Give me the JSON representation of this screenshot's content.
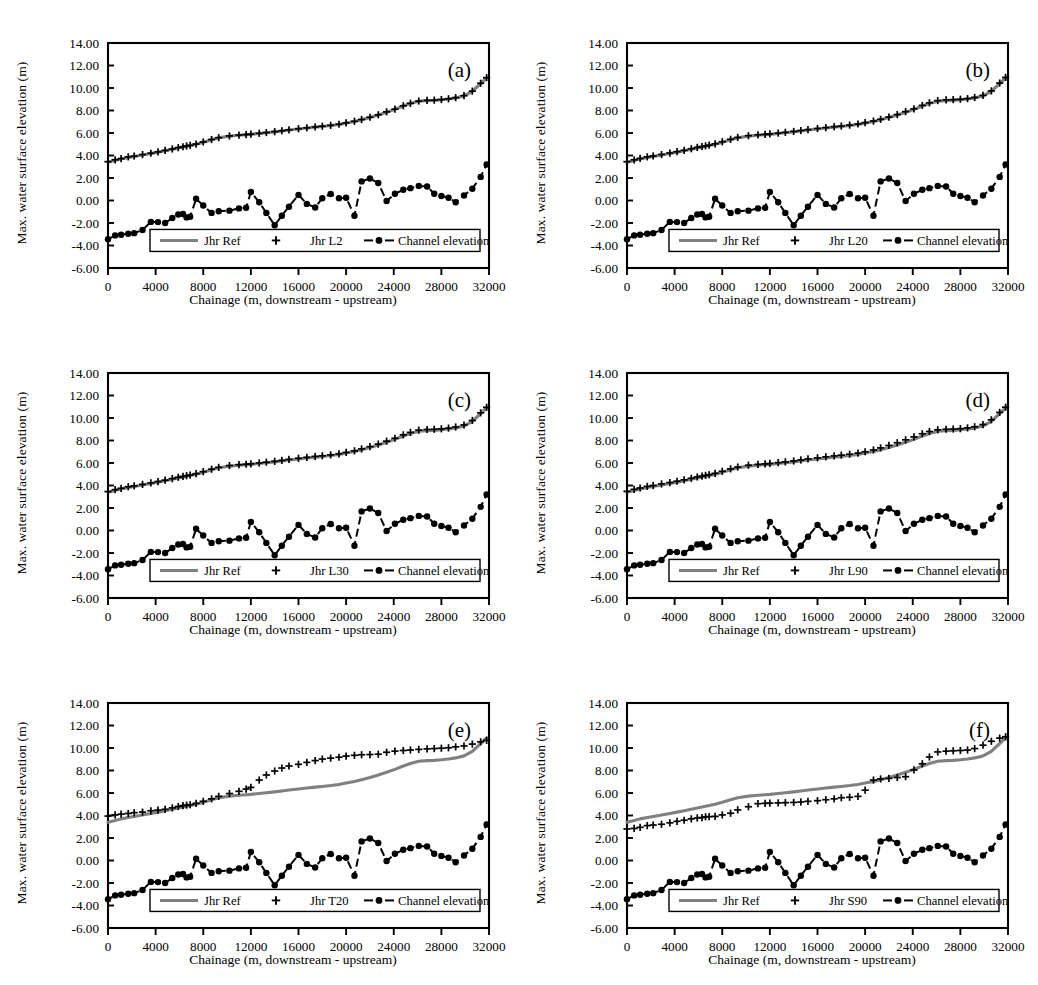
{
  "figure": {
    "panel_count": 6,
    "background": "#ffffff",
    "ink": "#000000",
    "ref_color": "#808080"
  },
  "axes": {
    "ylabel": "Max. water surface elevation (m)",
    "xlabel": "Chainage (m, downstream - upstream)",
    "ylim": [
      -6,
      14
    ],
    "xlim": [
      0,
      32000
    ],
    "ytick_step": 2,
    "xtick_step": 4000,
    "yticks": [
      "14.00",
      "12.00",
      "10.00",
      "8.00",
      "6.00",
      "4.00",
      "2.00",
      "0.00",
      "-2.00",
      "-4.00",
      "-6.00"
    ],
    "xticks": [
      "0",
      "4000",
      "8000",
      "12000",
      "16000",
      "20000",
      "24000",
      "28000",
      "32000"
    ],
    "grid": false
  },
  "legend": {
    "position": "lower-center-inside",
    "entries": [
      {
        "label": "Jhr Ref",
        "style": "solid-line",
        "color": "#808080"
      },
      {
        "label": "variant",
        "style": "plus-marker",
        "color": "#000000"
      },
      {
        "label": "Channel elevation",
        "style": "dashed-line-circle",
        "color": "#000000"
      }
    ]
  },
  "panels": [
    {
      "letter": "(a)",
      "variant_label": "Jhr L2"
    },
    {
      "letter": "(b)",
      "variant_label": "Jhr L20"
    },
    {
      "letter": "(c)",
      "variant_label": "Jhr L30"
    },
    {
      "letter": "(d)",
      "variant_label": "Jhr L90"
    },
    {
      "letter": "(e)",
      "variant_label": "Jhr T20"
    },
    {
      "letter": "(f)",
      "variant_label": "Jhr S90"
    }
  ],
  "caption": "",
  "chart_data": {
    "type": "line",
    "title": "",
    "xlabel": "Chainage (m, downstream - upstream)",
    "ylabel": "Max. water surface elevation (m)",
    "xlim": [
      0,
      32000
    ],
    "ylim": [
      -6,
      14
    ],
    "grid": false,
    "legend_position": "lower center inside axes",
    "x": [
      0,
      600,
      1100,
      1700,
      2200,
      2900,
      3600,
      4200,
      4800,
      5400,
      5900,
      6300,
      6600,
      6900,
      7400,
      8000,
      8700,
      9300,
      10200,
      11000,
      11600,
      12000,
      12700,
      13300,
      14000,
      14600,
      15200,
      16000,
      16700,
      17400,
      18000,
      18700,
      19400,
      20000,
      20700,
      21300,
      22000,
      22700,
      23400,
      24100,
      24800,
      25400,
      26100,
      26800,
      27400,
      28000,
      28600,
      29200,
      29900,
      30600,
      31300,
      31800
    ],
    "shared_series": [
      {
        "name": "Jhr Ref",
        "style": "solid",
        "color": "#808080",
        "values": [
          3.4,
          3.55,
          3.7,
          3.82,
          3.92,
          4.05,
          4.18,
          4.3,
          4.42,
          4.55,
          4.66,
          4.76,
          4.82,
          4.88,
          5.0,
          5.18,
          5.4,
          5.57,
          5.72,
          5.8,
          5.85,
          5.88,
          5.95,
          6.02,
          6.1,
          6.18,
          6.26,
          6.36,
          6.44,
          6.52,
          6.58,
          6.66,
          6.76,
          6.88,
          7.02,
          7.18,
          7.38,
          7.6,
          7.85,
          8.1,
          8.4,
          8.62,
          8.82,
          8.88,
          8.9,
          8.95,
          9.02,
          9.12,
          9.3,
          9.7,
          10.4,
          10.9
        ]
      },
      {
        "name": "Channel elevation",
        "style": "dashed-circle",
        "color": "#000000",
        "values": [
          -3.45,
          -3.1,
          -3.05,
          -2.95,
          -2.9,
          -2.62,
          -1.9,
          -1.92,
          -2.0,
          -1.55,
          -1.25,
          -1.2,
          -1.5,
          -1.45,
          0.15,
          -0.45,
          -1.1,
          -0.95,
          -0.9,
          -0.7,
          -0.65,
          0.75,
          -0.15,
          -1.1,
          -2.2,
          -1.35,
          -0.55,
          0.5,
          -0.3,
          -0.62,
          0.2,
          0.58,
          0.2,
          0.25,
          -1.35,
          1.7,
          1.95,
          1.55,
          -0.05,
          0.6,
          0.95,
          1.1,
          1.3,
          1.25,
          0.6,
          0.4,
          0.25,
          -0.15,
          0.45,
          1.05,
          2.1,
          3.2
        ]
      }
    ],
    "panels": [
      {
        "letter": "(a)",
        "series_name": "Jhr L2",
        "style": "plus",
        "color": "#000000",
        "values": [
          3.45,
          3.62,
          3.72,
          3.88,
          3.95,
          4.08,
          4.2,
          4.32,
          4.45,
          4.58,
          4.7,
          4.78,
          4.85,
          4.9,
          5.02,
          5.2,
          5.42,
          5.58,
          5.74,
          5.82,
          5.86,
          5.9,
          5.97,
          6.04,
          6.12,
          6.2,
          6.28,
          6.38,
          6.46,
          6.54,
          6.6,
          6.68,
          6.78,
          6.9,
          7.04,
          7.2,
          7.4,
          7.62,
          7.88,
          8.12,
          8.42,
          8.64,
          8.84,
          8.9,
          8.92,
          8.97,
          9.04,
          9.14,
          9.32,
          9.72,
          10.42,
          10.92
        ]
      },
      {
        "letter": "(b)",
        "series_name": "Jhr L20",
        "style": "plus",
        "color": "#000000",
        "values": [
          3.45,
          3.62,
          3.74,
          3.88,
          3.96,
          4.09,
          4.22,
          4.34,
          4.46,
          4.6,
          4.72,
          4.8,
          4.86,
          4.92,
          5.04,
          5.22,
          5.44,
          5.6,
          5.76,
          5.84,
          5.88,
          5.92,
          5.99,
          6.06,
          6.14,
          6.22,
          6.3,
          6.4,
          6.48,
          6.56,
          6.62,
          6.7,
          6.8,
          6.92,
          7.06,
          7.22,
          7.42,
          7.64,
          7.9,
          8.15,
          8.45,
          8.68,
          8.88,
          8.95,
          8.97,
          9.0,
          9.06,
          9.16,
          9.34,
          9.74,
          10.44,
          10.94
        ]
      },
      {
        "letter": "(c)",
        "series_name": "Jhr L30",
        "style": "plus",
        "color": "#000000",
        "values": [
          3.46,
          3.63,
          3.75,
          3.89,
          3.97,
          4.1,
          4.23,
          4.35,
          4.47,
          4.61,
          4.73,
          4.81,
          4.87,
          4.93,
          5.05,
          5.23,
          5.45,
          5.61,
          5.77,
          5.85,
          5.89,
          5.93,
          6.0,
          6.07,
          6.15,
          6.23,
          6.32,
          6.42,
          6.5,
          6.58,
          6.64,
          6.72,
          6.82,
          6.94,
          7.08,
          7.25,
          7.45,
          7.68,
          7.94,
          8.2,
          8.5,
          8.72,
          8.92,
          8.98,
          9.0,
          9.04,
          9.1,
          9.2,
          9.38,
          9.78,
          10.46,
          10.95
        ]
      },
      {
        "letter": "(d)",
        "series_name": "Jhr L90",
        "style": "plus",
        "color": "#000000",
        "values": [
          3.48,
          3.66,
          3.78,
          3.92,
          4.0,
          4.14,
          4.26,
          4.38,
          4.5,
          4.64,
          4.76,
          4.84,
          4.9,
          4.96,
          5.08,
          5.26,
          5.48,
          5.64,
          5.8,
          5.88,
          5.92,
          5.96,
          6.03,
          6.1,
          6.18,
          6.27,
          6.36,
          6.46,
          6.55,
          6.63,
          6.7,
          6.78,
          6.88,
          7.0,
          7.16,
          7.34,
          7.56,
          7.8,
          8.06,
          8.32,
          8.6,
          8.8,
          8.95,
          9.0,
          9.02,
          9.05,
          9.12,
          9.22,
          9.42,
          9.84,
          10.5,
          10.96
        ]
      },
      {
        "letter": "(e)",
        "series_name": "Jhr T20",
        "style": "plus",
        "color": "#000000",
        "values": [
          3.95,
          4.05,
          4.12,
          4.18,
          4.25,
          4.3,
          4.42,
          4.48,
          4.55,
          4.68,
          4.8,
          4.88,
          4.92,
          4.96,
          5.08,
          5.26,
          5.48,
          5.7,
          5.95,
          6.15,
          6.35,
          6.5,
          7.15,
          7.6,
          7.95,
          8.22,
          8.4,
          8.55,
          8.72,
          8.88,
          9.02,
          9.1,
          9.18,
          9.28,
          9.35,
          9.4,
          9.42,
          9.45,
          9.62,
          9.72,
          9.78,
          9.82,
          9.88,
          9.92,
          9.95,
          9.98,
          10.02,
          10.1,
          10.18,
          10.35,
          10.55,
          10.68
        ]
      },
      {
        "letter": "(f)",
        "series_name": "Jhr S90",
        "style": "plus",
        "color": "#000000",
        "values": [
          2.8,
          2.85,
          2.95,
          3.1,
          3.15,
          3.22,
          3.35,
          3.48,
          3.58,
          3.7,
          3.78,
          3.82,
          3.88,
          3.9,
          3.92,
          4.05,
          4.2,
          4.5,
          4.78,
          5.05,
          5.08,
          5.1,
          5.12,
          5.14,
          5.16,
          5.2,
          5.26,
          5.32,
          5.4,
          5.48,
          5.58,
          5.62,
          5.7,
          6.25,
          7.15,
          7.25,
          7.3,
          7.38,
          7.45,
          8.05,
          8.6,
          9.2,
          9.65,
          9.72,
          9.75,
          9.78,
          9.82,
          9.95,
          10.25,
          10.6,
          10.88,
          11.0
        ]
      }
    ]
  }
}
